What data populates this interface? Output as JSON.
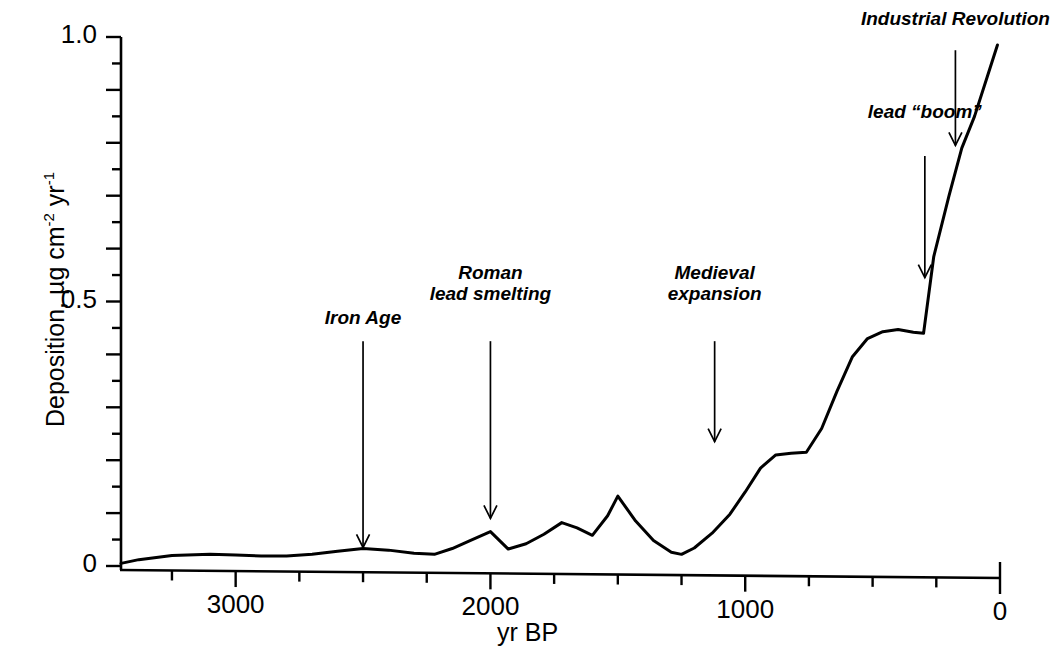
{
  "figure": {
    "background": "#ffffff",
    "ink_color": "#000000"
  },
  "axes": {
    "y_title": "Deposition, µg cm",
    "y_title_sup1": "-2",
    "y_title_mid": " yr",
    "y_title_sup2": "-1",
    "x_title": "yr BP",
    "y_ticks": [
      {
        "label": "1.0",
        "value": 1.0
      },
      {
        "label": "0.5",
        "value": 0.5
      },
      {
        "label": "0",
        "value": 0.0
      }
    ],
    "x_ticks": [
      {
        "label": "3000",
        "value": 3000
      },
      {
        "label": "2000",
        "value": 2000
      },
      {
        "label": "1000",
        "value": 1000
      },
      {
        "label": "0",
        "value": 0
      }
    ]
  },
  "annotations": [
    {
      "name": "iron-age",
      "lines": [
        "Iron Age"
      ],
      "x_value": 2500,
      "label_y": 0.455,
      "arrow_from_y": 0.425,
      "arrow_to_y": 0.035
    },
    {
      "name": "roman-lead-smelting",
      "lines": [
        "Roman",
        "lead smelting"
      ],
      "x_value": 2000,
      "label_y": 0.5,
      "arrow_from_y": 0.425,
      "arrow_to_y": 0.09
    },
    {
      "name": "medieval-expansion",
      "lines": [
        "Medieval",
        "expansion"
      ],
      "x_value": 1120,
      "label_y": 0.5,
      "arrow_from_y": 0.425,
      "arrow_to_y": 0.235
    },
    {
      "name": "lead-boom",
      "lines": [
        "lead “boom”"
      ],
      "x_value": 295,
      "label_y": 0.845,
      "arrow_from_y": 0.775,
      "arrow_to_y": 0.545
    },
    {
      "name": "industrial-revolution",
      "lines": [
        "Industrial Revolution"
      ],
      "x_value": 175,
      "label_y": 1.02,
      "arrow_from_y": 0.975,
      "arrow_to_y": 0.795
    }
  ],
  "chart_data": {
    "type": "line",
    "title": "",
    "xlabel": "yr BP",
    "ylabel": "Deposition, µg cm-2 yr-1",
    "xlim": [
      3450,
      0
    ],
    "ylim": [
      0,
      1.0
    ],
    "x_inverted": true,
    "grid": false,
    "legend": "none",
    "series": [
      {
        "name": "Lead deposition",
        "x": [
          3450,
          3380,
          3250,
          3100,
          3000,
          2900,
          2800,
          2700,
          2600,
          2500,
          2400,
          2300,
          2220,
          2150,
          2080,
          2000,
          1930,
          1860,
          1790,
          1720,
          1660,
          1600,
          1540,
          1500,
          1430,
          1360,
          1290,
          1250,
          1200,
          1130,
          1060,
          1000,
          940,
          880,
          820,
          760,
          700,
          640,
          580,
          520,
          460,
          400,
          340,
          300,
          260,
          200,
          150,
          100,
          50,
          10
        ],
        "y": [
          0.005,
          0.012,
          0.02,
          0.022,
          0.021,
          0.019,
          0.019,
          0.022,
          0.028,
          0.033,
          0.03,
          0.024,
          0.022,
          0.033,
          0.048,
          0.065,
          0.032,
          0.042,
          0.06,
          0.082,
          0.072,
          0.058,
          0.095,
          0.132,
          0.085,
          0.048,
          0.026,
          0.022,
          0.034,
          0.062,
          0.098,
          0.14,
          0.185,
          0.21,
          0.213,
          0.215,
          0.26,
          0.33,
          0.395,
          0.43,
          0.443,
          0.447,
          0.442,
          0.44,
          0.585,
          0.7,
          0.79,
          0.85,
          0.925,
          0.985
        ]
      }
    ]
  }
}
